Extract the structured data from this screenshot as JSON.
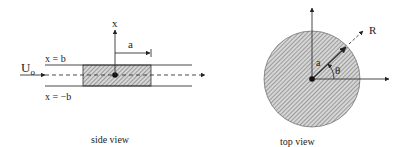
{
  "side_view": {
    "caption": "side view",
    "flow_label": "U",
    "flow_subscript": "o",
    "upper_wall_label": "x = b",
    "lower_wall_label": "x = −b",
    "axis_label": "x",
    "radius_label": "a"
  },
  "top_view": {
    "caption": "top view",
    "radial_label": "R",
    "radius_label": "a",
    "angle_label": "θ"
  },
  "colors": {
    "line": "#222222",
    "hatch_fill": "#b8b8b8",
    "background": "#ffffff"
  }
}
